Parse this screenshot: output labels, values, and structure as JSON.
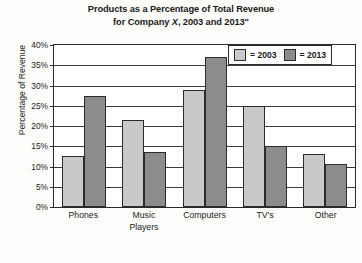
{
  "chart_data": {
    "type": "bar",
    "title_line1": "Products as a Percentage of Total Revenue",
    "title_line2_pre": "for Company ",
    "title_line2_ital": "X",
    "title_line2_post": ", 2003 and 2013\"",
    "title": "Products as a Percentage of Total Revenue for Company X, 2003 and 2013\"",
    "xlabel": "",
    "ylabel": "Percentage of Revenue",
    "ylim": [
      0,
      40
    ],
    "ytick_labels": [
      "40%",
      "35%",
      "30%",
      "25%",
      "20%",
      "15%",
      "10%",
      "5%",
      "0%"
    ],
    "ytick_values": [
      40,
      35,
      30,
      25,
      20,
      15,
      10,
      5,
      0
    ],
    "grid": true,
    "legend_position": "top-right",
    "categories": [
      "Phones",
      "Music\nPlayers",
      "Computers",
      "TV's",
      "Other"
    ],
    "series": [
      {
        "name": "= 2003",
        "color": "#c9c9c9",
        "values": [
          12.5,
          21.5,
          29,
          25,
          13
        ]
      },
      {
        "name": "= 2013",
        "color": "#8c8c8c",
        "values": [
          27.5,
          13.5,
          37,
          15,
          10.5
        ]
      }
    ]
  }
}
